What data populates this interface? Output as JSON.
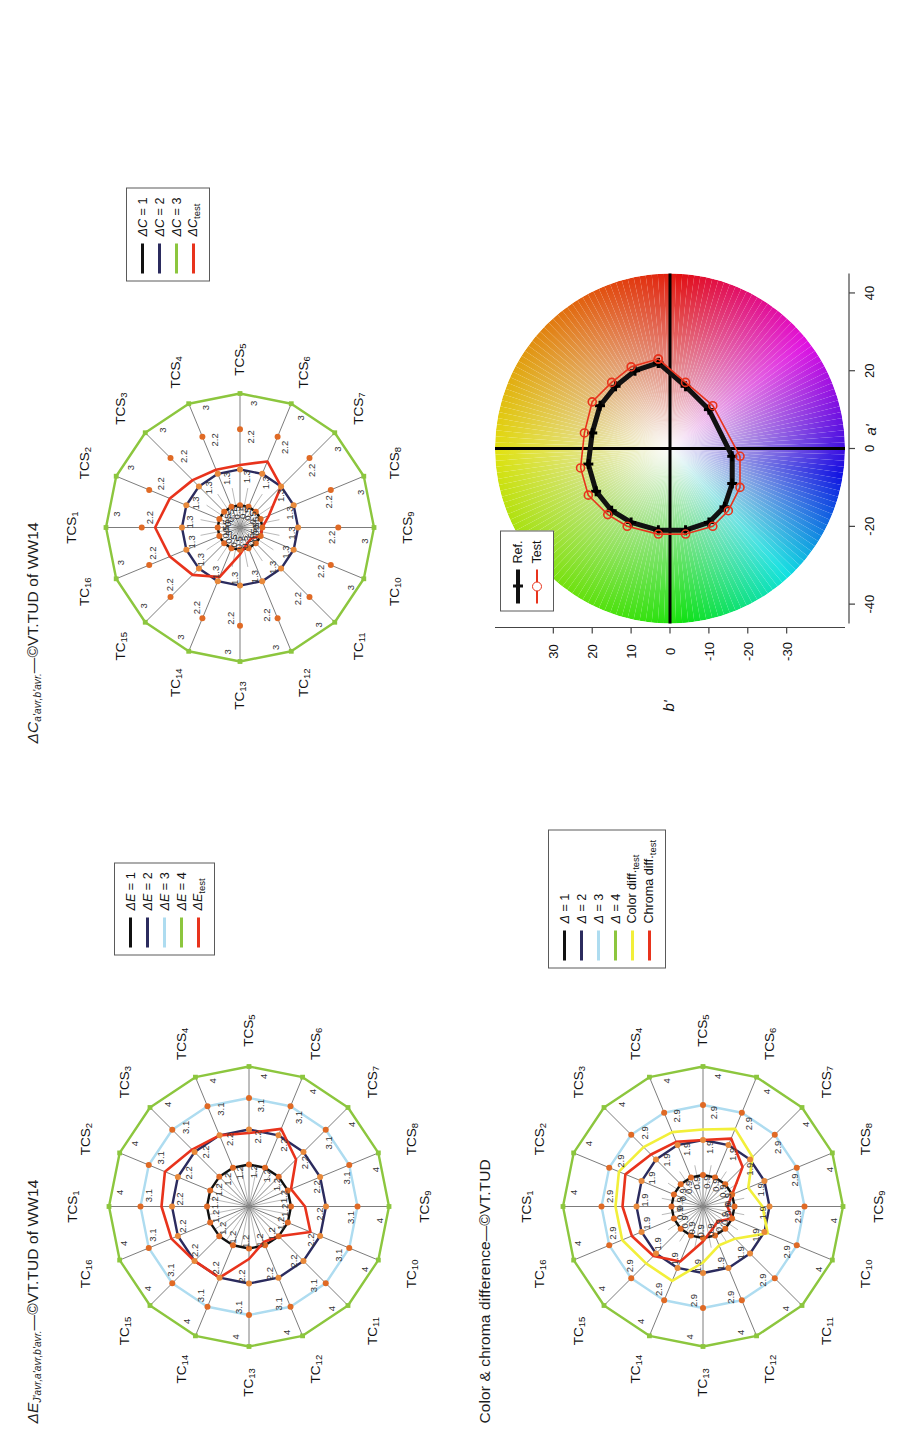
{
  "figure": {
    "orientation_deg": -90,
    "panels": [
      "delta-e-radar",
      "delta-c-radar",
      "color-chroma-radar",
      "ab-chromaticity"
    ]
  },
  "panel_delta_e": {
    "title_main": "ΔE",
    "title_sub": "J'avr,a'avr,b'avr.",
    "title_tail": "—©VT.TUD of WW14",
    "legend": {
      "items": [
        {
          "label_main": "ΔE = 1",
          "color": "#111111"
        },
        {
          "label_main": "ΔE = 2",
          "color": "#2b2b5e"
        },
        {
          "label_main": "ΔE = 3",
          "color": "#aedcf0"
        },
        {
          "label_main": "ΔE = 4",
          "color": "#8cc63e"
        },
        {
          "label_main": "ΔE",
          "label_sub": "test",
          "color": "#e8331c"
        }
      ]
    }
  },
  "panel_delta_c": {
    "title_main": "ΔC",
    "title_sub": "a'avr,b'avr.",
    "title_tail": "—©VT.TUD of WW14",
    "legend": {
      "items": [
        {
          "label_main": "ΔC = 1",
          "color": "#111111"
        },
        {
          "label_main": "ΔC = 2",
          "color": "#2b2b5e"
        },
        {
          "label_main": "ΔC = 3",
          "color": "#8cc63e"
        },
        {
          "label_main": "ΔC",
          "label_sub": "test",
          "color": "#e8331c"
        }
      ]
    }
  },
  "panel_color_chroma": {
    "title_main": "Color & chroma difference—©VT.TUD",
    "legend": {
      "items": [
        {
          "label_main": "Δ = 1",
          "color": "#111111"
        },
        {
          "label_main": "Δ = 2",
          "color": "#2b2b5e"
        },
        {
          "label_main": "Δ = 3",
          "color": "#aedcf0"
        },
        {
          "label_main": "Δ = 4",
          "color": "#8cc63e"
        },
        {
          "label_main": "Color diff.",
          "label_sub": "test",
          "color": "#f2ef3a"
        },
        {
          "label_main": "Chroma diff.",
          "label_sub": "test",
          "color": "#e8331c"
        }
      ]
    }
  },
  "panel_ab": {
    "xlabel": "a'",
    "ylabel": "b'",
    "xticks": [
      "-40",
      "-20",
      "0",
      "20",
      "40"
    ],
    "yticks": [
      "30",
      "20",
      "10",
      "0",
      "-10",
      "-20",
      "-30"
    ],
    "legend": {
      "items": [
        {
          "label": "Ref.",
          "color": "#111111",
          "marker": "plus-thick"
        },
        {
          "label": "Test",
          "color": "#e8331c",
          "marker": "circle-open"
        }
      ]
    }
  },
  "axis_labels": [
    "TCS1",
    "TCS2",
    "TCS3",
    "TCS4",
    "TCS5",
    "TCS6",
    "TCS7",
    "TCS8",
    "TCS9",
    "TC10",
    "TC11",
    "TC12",
    "TC13",
    "TC14",
    "TC15",
    "TC16"
  ],
  "swatches": {
    "single_first": {
      "label_main": "TCS",
      "label_sub": "1",
      "color": "#e8321d"
    },
    "strip": [
      {
        "label_main": "TCS",
        "label_sub": "2",
        "color": "#e1502a"
      },
      {
        "label_main": "TCS",
        "label_sub": "3",
        "color": "#f5953c"
      },
      {
        "label_main": "TCS",
        "label_sub": "4",
        "color": "#f5c council"
      },
      {
        "label_main": "TCS",
        "label_sub": "5",
        "color": "#bcd45a"
      },
      {
        "label_main": "TCS",
        "label_sub": "6",
        "color": "#7cb85a"
      },
      {
        "label_main": "TCS",
        "label_sub": "7",
        "color": "#4f9a6e"
      },
      {
        "label_main": "TCS",
        "label_sub": "8",
        "color": "#36745f"
      },
      {
        "label_main": "TCS",
        "label_sub": "9",
        "color": "#63b09c"
      },
      {
        "label_main": "TC",
        "label_sub": "10",
        "color": "#3f8fb5"
      },
      {
        "label_main": "TC",
        "label_sub": "11",
        "color": "#2a6aa8"
      },
      {
        "label_main": "TC",
        "label_sub": "12",
        "color": "#2f3f8c"
      },
      {
        "label_main": "TC",
        "label_sub": "13",
        "color": "#5a4a7e"
      },
      {
        "label_main": "TC",
        "label_sub": "14",
        "color": "#42203a"
      },
      {
        "label_main": "TC",
        "label_sub": "15",
        "color": "#9b5a70"
      }
    ],
    "single_last": {
      "label_main": "TC",
      "label_sub": "16",
      "color": "#a82b33"
    }
  },
  "chart_data": [
    {
      "id": "delta-e-radar",
      "type": "radar",
      "title": "ΔE J'avr,a'avr,b'avr. —©VT.TUD of WW14",
      "categories": [
        "TCS1",
        "TCS2",
        "TCS3",
        "TCS4",
        "TCS5",
        "TCS6",
        "TCS7",
        "TCS8",
        "TCS9",
        "TC10",
        "TC11",
        "TC12",
        "TC13",
        "TC14",
        "TC15",
        "TC16"
      ],
      "rings": [
        1.2,
        2.2,
        3.1,
        4
      ],
      "ring_labels": [
        "1.2",
        "2.2",
        "3.1",
        "4"
      ],
      "rmax": 4,
      "series": [
        {
          "name": "ΔE = 1",
          "color": "#111111",
          "constant": 1.2,
          "values": [
            1.2,
            1.2,
            1.2,
            1.2,
            1.2,
            1.2,
            1.2,
            1.2,
            1.2,
            1.2,
            1.2,
            1.2,
            1.2,
            1.2,
            1.2,
            1.2
          ]
        },
        {
          "name": "ΔE = 2",
          "color": "#2b2b5e",
          "constant": 2.2,
          "values": [
            2.2,
            2.2,
            2.2,
            2.2,
            2.2,
            2.2,
            2.2,
            2.2,
            2.2,
            2.2,
            2.2,
            2.2,
            2.2,
            2.2,
            2.2,
            2.2
          ]
        },
        {
          "name": "ΔE = 3",
          "color": "#aedcf0",
          "constant": 3.1,
          "values": [
            3.1,
            3.1,
            3.1,
            3.1,
            3.1,
            3.1,
            3.1,
            3.1,
            3.1,
            3.1,
            3.1,
            3.1,
            3.1,
            3.1,
            3.1,
            3.1
          ]
        },
        {
          "name": "ΔE = 4",
          "color": "#8cc63e",
          "constant": 4,
          "values": [
            4,
            4,
            4,
            4,
            4,
            4,
            4,
            4,
            4,
            4,
            4,
            4,
            4,
            4,
            4,
            4
          ]
        },
        {
          "name": "ΔE test",
          "color": "#e8331c",
          "values": [
            2.5,
            2.6,
            2.3,
            2.2,
            2.1,
            2.4,
            1.9,
            1.3,
            1.6,
            1.9,
            1.2,
            1.1,
            1.5,
            2.2,
            2.2,
            2.4
          ]
        }
      ]
    },
    {
      "id": "delta-c-radar",
      "type": "radar",
      "title": "ΔC a'avr,b'avr. —©VT.TUD of WW14",
      "categories": [
        "TCS1",
        "TCS2",
        "TCS3",
        "TCS4",
        "TCS5",
        "TCS6",
        "TCS7",
        "TCS8",
        "TCS9",
        "TC10",
        "TC11",
        "TC12",
        "TC13",
        "TC14",
        "TC15",
        "TC16"
      ],
      "rings": [
        0.5,
        1.3,
        2.2,
        3
      ],
      "ring_labels": [
        "0.5",
        "1.3",
        "2.2",
        "3"
      ],
      "rmax": 3,
      "series": [
        {
          "name": "ΔC = 1",
          "color": "#111111",
          "constant": 0.5,
          "values": [
            0.5,
            0.5,
            0.5,
            0.5,
            0.5,
            0.5,
            0.5,
            0.5,
            0.5,
            0.5,
            0.5,
            0.5,
            0.5,
            0.5,
            0.5,
            0.5
          ]
        },
        {
          "name": "ΔC = 2",
          "color": "#2b2b5e",
          "constant": 1.3,
          "values": [
            1.3,
            1.3,
            1.3,
            1.3,
            1.3,
            1.3,
            1.3,
            1.3,
            1.3,
            1.3,
            1.3,
            1.3,
            1.3,
            1.3,
            1.3,
            1.3
          ]
        },
        {
          "name": "ΔC = 3",
          "color": "#8cc63e",
          "constant": 3,
          "values": [
            3,
            3,
            3,
            3,
            3,
            3,
            3,
            3,
            3,
            3,
            3,
            3,
            3,
            3,
            3,
            3
          ]
        },
        {
          "name": "ΔC test",
          "color": "#e8331c",
          "values": [
            1.9,
            1.7,
            1.5,
            1.4,
            1.4,
            1.6,
            1.3,
            0.7,
            0.5,
            0.5,
            0.35,
            0.4,
            0.6,
            1.2,
            1.5,
            1.7
          ]
        }
      ]
    },
    {
      "id": "color-chroma-radar",
      "type": "radar",
      "title": "Color & chroma difference—©VT.TUD",
      "categories": [
        "TCS1",
        "TCS2",
        "TCS3",
        "TCS4",
        "TCS5",
        "TCS6",
        "TCS7",
        "TCS8",
        "TCS9",
        "TC10",
        "TC11",
        "TC12",
        "TC13",
        "TC14",
        "TC15",
        "TC16"
      ],
      "rings": [
        0.9,
        1.9,
        2.9,
        4
      ],
      "ring_labels": [
        "0.9",
        "1.9",
        "2.9",
        "4"
      ],
      "rmax": 4,
      "series": [
        {
          "name": "Δ = 1",
          "color": "#111111",
          "constant": 0.9,
          "values": [
            0.9,
            0.9,
            0.9,
            0.9,
            0.9,
            0.9,
            0.9,
            0.9,
            0.9,
            0.9,
            0.9,
            0.9,
            0.9,
            0.9,
            0.9,
            0.9
          ]
        },
        {
          "name": "Δ = 2",
          "color": "#2b2b5e",
          "constant": 1.9,
          "values": [
            1.9,
            1.9,
            1.9,
            1.9,
            1.9,
            1.9,
            1.9,
            1.9,
            1.9,
            1.9,
            1.9,
            1.9,
            1.9,
            1.9,
            1.9,
            1.9
          ]
        },
        {
          "name": "Δ = 3",
          "color": "#aedcf0",
          "constant": 2.9,
          "values": [
            2.9,
            2.9,
            2.9,
            2.9,
            2.9,
            2.9,
            2.9,
            2.9,
            2.9,
            2.9,
            2.9,
            2.9,
            2.9,
            2.9,
            2.9,
            2.9
          ]
        },
        {
          "name": "Δ = 4",
          "color": "#8cc63e",
          "constant": 4,
          "values": [
            4,
            4,
            4,
            4,
            4,
            4,
            4,
            4,
            4,
            4,
            4,
            4,
            4,
            4,
            4,
            4
          ]
        },
        {
          "name": "Color diff. test",
          "color": "#f2ef3a",
          "values": [
            2.5,
            2.6,
            2.4,
            2.3,
            2.2,
            2.4,
            2.0,
            1.4,
            1.7,
            2.0,
            1.3,
            1.2,
            1.6,
            2.3,
            2.3,
            2.5
          ]
        },
        {
          "name": "Chroma diff. test",
          "color": "#e8331c",
          "values": [
            2.3,
            2.4,
            2.1,
            2.0,
            1.9,
            2.1,
            1.6,
            0.9,
            0.7,
            0.9,
            0.6,
            0.7,
            1.0,
            1.7,
            2.0,
            2.2
          ]
        }
      ]
    },
    {
      "id": "ab-chromaticity",
      "type": "scatter",
      "title": "a' b' chromaticity loci",
      "xlabel": "a'",
      "ylabel": "b'",
      "xlim": [
        -45,
        45
      ],
      "ylim": [
        -35,
        35
      ],
      "series": [
        {
          "name": "Ref.",
          "color": "#111111",
          "points": [
            [
              22,
              3
            ],
            [
              20,
              9
            ],
            [
              16,
              14
            ],
            [
              11,
              18
            ],
            [
              4,
              20
            ],
            [
              -4,
              21
            ],
            [
              -11,
              19
            ],
            [
              -16,
              15
            ],
            [
              -19,
              10
            ],
            [
              -21,
              3
            ],
            [
              -21,
              -4
            ],
            [
              -19,
              -10
            ],
            [
              -15,
              -14
            ],
            [
              -9,
              -16
            ],
            [
              -2,
              -16
            ],
            [
              10,
              -10
            ],
            [
              16,
              -4
            ],
            [
              22,
              3
            ]
          ]
        },
        {
          "name": "Test",
          "color": "#e8331c",
          "points": [
            [
              23,
              3
            ],
            [
              21,
              10
            ],
            [
              17,
              15
            ],
            [
              12,
              20
            ],
            [
              4,
              22
            ],
            [
              -5,
              23
            ],
            [
              -12,
              21
            ],
            [
              -17,
              16
            ],
            [
              -20,
              11
            ],
            [
              -22,
              3
            ],
            [
              -22,
              -4
            ],
            [
              -20,
              -11
            ],
            [
              -16,
              -15
            ],
            [
              -10,
              -18
            ],
            [
              -2,
              -18
            ],
            [
              11,
              -11
            ],
            [
              17,
              -4
            ],
            [
              23,
              3
            ]
          ]
        }
      ]
    }
  ]
}
